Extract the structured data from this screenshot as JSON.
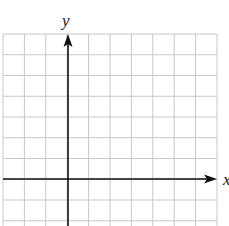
{
  "diagram": {
    "type": "coordinate-grid",
    "x_axis_label": "x",
    "y_axis_label": "y",
    "grid": {
      "columns": 10,
      "rows": 9,
      "left": 3,
      "top": 34,
      "right": 217,
      "bottom": 226,
      "cell_width": 21.4,
      "cell_height": 20.75,
      "line_color": "#c8c8c8"
    },
    "axes": {
      "color": "#111111",
      "y_axis_x": 68,
      "x_axis_y": 179,
      "x_axis_start": 3,
      "x_axis_end": 217,
      "y_axis_top": 34,
      "y_axis_bottom": 226
    }
  }
}
